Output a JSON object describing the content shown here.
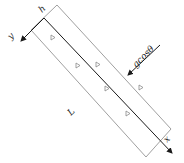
{
  "diagram": {
    "labels": {
      "origin": "h",
      "x_axis": "x",
      "y_axis": "y",
      "length": "L",
      "gravity": "gcosθ"
    },
    "markers": {
      "count": 6,
      "glyph": "▷"
    },
    "colors": {
      "outline": "#9a9a9a",
      "axis": "#1a1a1a",
      "text": "#222222",
      "background": "#ffffff"
    }
  }
}
